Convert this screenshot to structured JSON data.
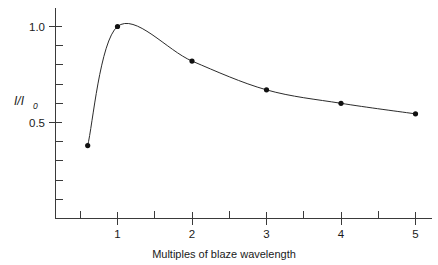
{
  "chart_data": {
    "type": "line",
    "title": "",
    "xlabel": "Multiples of blaze wavelength",
    "ylabel": "I/I_0",
    "ylabel_main": "I/I",
    "ylabel_sub": "0",
    "x": [
      0.6,
      1.0,
      2.0,
      3.0,
      4.0,
      5.0
    ],
    "values": [
      0.38,
      1.0,
      0.82,
      0.67,
      0.6,
      0.545
    ],
    "series": [
      {
        "name": "blaze efficiency",
        "points": [
          {
            "x": 0.6,
            "y": 0.38
          },
          {
            "x": 1.0,
            "y": 1.0
          },
          {
            "x": 2.0,
            "y": 0.82
          },
          {
            "x": 3.0,
            "y": 0.67
          },
          {
            "x": 4.0,
            "y": 0.6
          },
          {
            "x": 5.0,
            "y": 0.545
          }
        ]
      }
    ],
    "xlim": [
      0.42,
      5.3
    ],
    "ylim": [
      0.0,
      1.13
    ],
    "xticks": [
      1,
      2,
      3,
      4,
      5
    ],
    "xtick_labels": [
      "1",
      "2",
      "3",
      "4",
      "5"
    ],
    "xticks_minor": [
      0.5,
      1.5,
      2.5,
      3.5,
      4.5
    ],
    "yticks": [
      0.5,
      1.0
    ],
    "ytick_labels": [
      "0.5",
      "1.0"
    ],
    "yticks_minor": [
      0.1,
      0.2,
      0.3,
      0.4,
      0.6,
      0.7,
      0.8,
      0.9
    ],
    "grid": false,
    "legend": false,
    "marker": "filled-circle",
    "line_color": "#2b2b2b",
    "marker_color": "#111111",
    "axis_color": "#3a3a3a",
    "background": "#ffffff"
  }
}
